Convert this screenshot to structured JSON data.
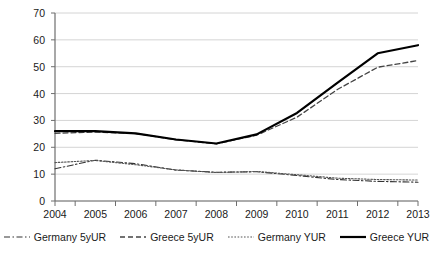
{
  "chart_data": {
    "type": "line",
    "title": "",
    "xlabel": "",
    "ylabel": "",
    "categories": [
      "2004",
      "2005",
      "2006",
      "2007",
      "2008",
      "2009",
      "2010",
      "2011",
      "2012",
      "2013"
    ],
    "ylim": [
      0,
      70
    ],
    "yticks": [
      0,
      10,
      20,
      30,
      40,
      50,
      60,
      70
    ],
    "grid": true,
    "legend_position": "bottom",
    "series": [
      {
        "name": "Germany 5yUR",
        "style": "dash-dot",
        "color": "#333333",
        "width": 1.1,
        "values": [
          12.0,
          15.2,
          13.9,
          11.5,
          10.7,
          10.9,
          9.5,
          8.0,
          7.3,
          7.0
        ]
      },
      {
        "name": "Greece 5yUR",
        "style": "dashed",
        "color": "#444444",
        "width": 1.3,
        "values": [
          25.2,
          25.7,
          25.1,
          22.8,
          21.3,
          24.5,
          31.2,
          41.5,
          49.8,
          52.3
        ]
      },
      {
        "name": "Germany YUR",
        "style": "dotted",
        "color": "#555555",
        "width": 1.1,
        "values": [
          14.3,
          15.1,
          13.5,
          11.6,
          10.6,
          11.0,
          9.8,
          8.5,
          8.0,
          7.8
        ]
      },
      {
        "name": "Greece YUR",
        "style": "solid",
        "color": "#000000",
        "width": 2.2,
        "values": [
          26.0,
          26.0,
          25.2,
          22.9,
          21.4,
          24.8,
          32.8,
          44.0,
          55.0,
          58.0
        ]
      }
    ]
  },
  "axes": {
    "y_tick_labels": [
      "70",
      "60",
      "50",
      "40",
      "30",
      "20",
      "10",
      "0"
    ],
    "x_tick_labels": [
      "2004",
      "2005",
      "2006",
      "2007",
      "2008",
      "2009",
      "2010",
      "2011",
      "2012",
      "2013"
    ]
  },
  "legend": {
    "items": [
      {
        "label": "Germany 5yUR",
        "icon": "dash-dot-line-icon"
      },
      {
        "label": "Greece 5yUR",
        "icon": "dashed-line-icon"
      },
      {
        "label": "Germany YUR",
        "icon": "dotted-line-icon"
      },
      {
        "label": "Greece YUR",
        "icon": "solid-line-icon"
      }
    ]
  }
}
